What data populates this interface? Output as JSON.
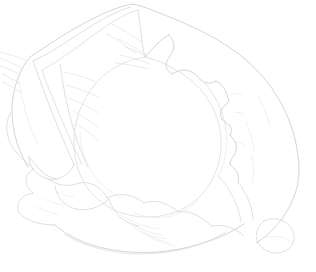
{
  "canvas": {
    "width": 316,
    "height": 272,
    "background_color": "#ffffff",
    "title": "Cabbage line drawing"
  },
  "artwork": {
    "subject": "cabbage",
    "style": "contour line drawing",
    "caption": "Faint pencil contour sketch of a head of cabbage with outer wrapper leaves",
    "line_color": "#d9d9dd",
    "outer_line_color": "#d2d2d7",
    "inner_line_color": "#dcdce0",
    "vein_line_color": "#e3e3e7",
    "faint_line_color": "#e8e8eb",
    "background_color": "#ffffff"
  },
  "parts": {
    "outer_silhouette": "outer-leaf-silhouette",
    "inner_head": "inner-head-contour",
    "left_leaf": "left-wrapper-leaf",
    "right_leaf": "right-wrapper-leaf",
    "top_leaf": "top-wrapper-leaf",
    "bottom_leaves": "bottom-ruffled-leaves",
    "veins": "leaf-vein-lines",
    "base": "base-contour"
  }
}
